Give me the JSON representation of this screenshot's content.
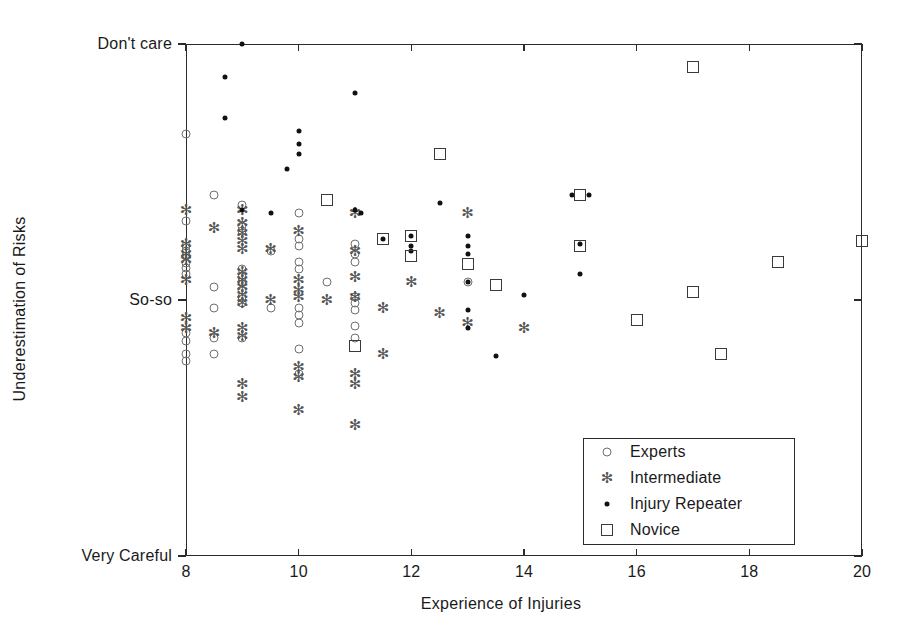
{
  "chart_data": {
    "type": "scatter",
    "title": "",
    "xlabel": "Experience of Injuries",
    "ylabel": "Underestimation of Risks",
    "xlim": [
      8,
      20
    ],
    "ylim": [
      0,
      10
    ],
    "xticks": [
      8,
      10,
      12,
      14,
      16,
      18,
      20
    ],
    "xticklabels": [
      "8",
      "10",
      "12",
      "14",
      "16",
      "18",
      "20"
    ],
    "yticks": [
      10,
      5,
      0
    ],
    "yticklabels": [
      "Don't care",
      "So-so",
      "Very Careful"
    ],
    "grid": false,
    "legend_position": "lower right",
    "series": [
      {
        "name": "Experts",
        "marker": "circle",
        "points": [
          [
            8.0,
            8.25
          ],
          [
            8.0,
            6.55
          ],
          [
            8.0,
            6.05
          ],
          [
            8.0,
            5.95
          ],
          [
            8.0,
            5.85
          ],
          [
            8.0,
            5.72
          ],
          [
            8.0,
            5.62
          ],
          [
            8.0,
            5.5
          ],
          [
            8.0,
            4.35
          ],
          [
            8.0,
            4.2
          ],
          [
            8.0,
            3.95
          ],
          [
            8.0,
            3.8
          ],
          [
            8.5,
            7.05
          ],
          [
            8.5,
            5.25
          ],
          [
            8.5,
            4.85
          ],
          [
            8.5,
            4.25
          ],
          [
            8.5,
            3.95
          ],
          [
            9.0,
            6.85
          ],
          [
            9.0,
            6.45
          ],
          [
            9.0,
            6.35
          ],
          [
            9.0,
            5.6
          ],
          [
            9.0,
            5.45
          ],
          [
            9.0,
            5.35
          ],
          [
            9.0,
            5.2
          ],
          [
            9.0,
            5.05
          ],
          [
            9.0,
            4.95
          ],
          [
            9.0,
            4.25
          ],
          [
            9.5,
            5.95
          ],
          [
            9.5,
            4.85
          ],
          [
            10.0,
            6.7
          ],
          [
            10.0,
            6.2
          ],
          [
            10.0,
            6.05
          ],
          [
            10.0,
            5.75
          ],
          [
            10.0,
            5.6
          ],
          [
            10.0,
            4.85
          ],
          [
            10.0,
            4.7
          ],
          [
            10.0,
            4.55
          ],
          [
            10.0,
            4.05
          ],
          [
            10.0,
            3.55
          ],
          [
            10.5,
            5.35
          ],
          [
            11.0,
            6.1
          ],
          [
            11.0,
            5.9
          ],
          [
            11.0,
            5.75
          ],
          [
            11.0,
            5.05
          ],
          [
            11.0,
            4.95
          ],
          [
            11.0,
            4.8
          ],
          [
            11.0,
            4.5
          ],
          [
            11.0,
            4.25
          ],
          [
            13.0,
            5.35
          ]
        ]
      },
      {
        "name": "Intermediate",
        "marker": "star",
        "points": [
          [
            8.0,
            6.75
          ],
          [
            8.0,
            6.1
          ],
          [
            8.0,
            5.9
          ],
          [
            8.0,
            5.78
          ],
          [
            8.0,
            5.4
          ],
          [
            8.0,
            4.65
          ],
          [
            8.0,
            4.45
          ],
          [
            8.5,
            6.4
          ],
          [
            8.5,
            4.35
          ],
          [
            9.0,
            6.75
          ],
          [
            9.0,
            6.5
          ],
          [
            9.0,
            6.3
          ],
          [
            9.0,
            6.15
          ],
          [
            9.0,
            6.0
          ],
          [
            9.0,
            5.55
          ],
          [
            9.0,
            5.4
          ],
          [
            9.0,
            5.25
          ],
          [
            9.0,
            5.1
          ],
          [
            9.0,
            4.95
          ],
          [
            9.0,
            4.45
          ],
          [
            9.0,
            4.3
          ],
          [
            9.0,
            3.35
          ],
          [
            9.0,
            3.1
          ],
          [
            9.5,
            6.0
          ],
          [
            9.5,
            5.0
          ],
          [
            10.0,
            6.35
          ],
          [
            10.0,
            5.4
          ],
          [
            10.0,
            5.2
          ],
          [
            10.0,
            5.05
          ],
          [
            10.0,
            3.7
          ],
          [
            10.0,
            3.5
          ],
          [
            10.0,
            2.85
          ],
          [
            10.5,
            5.0
          ],
          [
            11.0,
            6.7
          ],
          [
            11.0,
            5.95
          ],
          [
            11.0,
            5.45
          ],
          [
            11.0,
            5.05
          ],
          [
            11.0,
            3.55
          ],
          [
            11.0,
            3.35
          ],
          [
            11.0,
            2.55
          ],
          [
            11.5,
            4.85
          ],
          [
            11.5,
            3.95
          ],
          [
            12.0,
            5.35
          ],
          [
            12.5,
            4.75
          ],
          [
            13.0,
            6.7
          ],
          [
            13.0,
            4.55
          ],
          [
            14.0,
            4.45
          ]
        ]
      },
      {
        "name": "Injury Repeater",
        "marker": "dot",
        "points": [
          [
            9.0,
            10.0
          ],
          [
            8.7,
            9.35
          ],
          [
            8.7,
            8.55
          ],
          [
            9.0,
            6.75
          ],
          [
            9.5,
            6.7
          ],
          [
            10.0,
            8.3
          ],
          [
            10.0,
            8.05
          ],
          [
            10.0,
            7.85
          ],
          [
            9.8,
            7.55
          ],
          [
            11.0,
            9.05
          ],
          [
            11.0,
            6.75
          ],
          [
            11.1,
            6.7
          ],
          [
            11.5,
            6.2
          ],
          [
            12.0,
            6.25
          ],
          [
            12.0,
            6.05
          ],
          [
            12.0,
            5.95
          ],
          [
            13.0,
            6.25
          ],
          [
            13.0,
            6.05
          ],
          [
            13.0,
            5.9
          ],
          [
            13.0,
            5.35
          ],
          [
            13.0,
            4.8
          ],
          [
            13.0,
            4.45
          ],
          [
            13.5,
            3.9
          ],
          [
            14.0,
            5.1
          ],
          [
            15.0,
            6.1
          ],
          [
            15.0,
            5.5
          ],
          [
            14.85,
            7.05
          ],
          [
            15.15,
            7.05
          ],
          [
            12.5,
            6.9
          ]
        ]
      },
      {
        "name": "Novice",
        "marker": "square",
        "points": [
          [
            10.5,
            6.95
          ],
          [
            11.0,
            4.1
          ],
          [
            11.5,
            6.2
          ],
          [
            12.0,
            6.25
          ],
          [
            12.0,
            5.85
          ],
          [
            12.5,
            7.85
          ],
          [
            13.0,
            5.7
          ],
          [
            13.5,
            5.3
          ],
          [
            15.0,
            7.05
          ],
          [
            15.0,
            6.05
          ],
          [
            16.0,
            4.6
          ],
          [
            17.0,
            9.55
          ],
          [
            17.0,
            5.15
          ],
          [
            17.5,
            3.95
          ],
          [
            18.5,
            5.75
          ],
          [
            20.0,
            6.15
          ]
        ]
      }
    ]
  },
  "legend": {
    "items": [
      {
        "label": "Experts",
        "marker": "circle"
      },
      {
        "label": "Intermediate",
        "marker": "star"
      },
      {
        "label": "Injury Repeater",
        "marker": "dot"
      },
      {
        "label": "Novice",
        "marker": "square"
      }
    ]
  },
  "colors": {
    "axis": "#2b2b2b",
    "circle": "#6f6f6f",
    "star": "#555555",
    "dot": "#111111",
    "square": "#3a3a3a",
    "background": "#ffffff"
  }
}
